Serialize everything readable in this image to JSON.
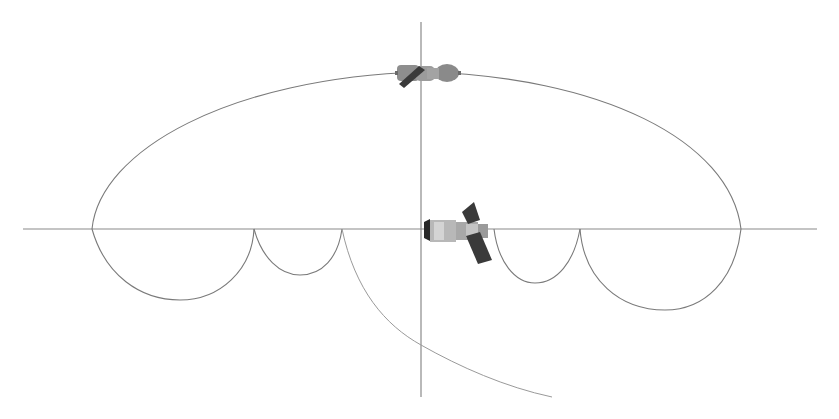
{
  "diagram": {
    "colors": {
      "background": "#ffffff",
      "axis": "#8a8a8a",
      "orbit": "#7a7a7a",
      "panel_dark": "#3f3f3f",
      "body_grey": "#9a9a9a"
    },
    "axes": {
      "horizontal": {
        "x1": 23,
        "y": 229,
        "x2": 817
      },
      "vertical": {
        "x": 421,
        "y1": 22,
        "y2": 397
      }
    },
    "transfer_ellipse": {
      "left_vertex": [
        92,
        229
      ],
      "apex": [
        421,
        72
      ],
      "right_vertex": [
        741,
        229
      ]
    },
    "phasing_arcs": [
      {
        "from": [
          92,
          229
        ],
        "to": [
          254,
          229
        ],
        "depth": 300
      },
      {
        "from": [
          254,
          229
        ],
        "to": [
          342,
          229
        ],
        "depth": 275
      },
      {
        "from": [
          494,
          229
        ],
        "to": [
          580,
          229
        ],
        "depth": 283
      },
      {
        "from": [
          580,
          229
        ],
        "to": [
          741,
          229
        ],
        "depth": 310
      }
    ],
    "descent_trajectory": {
      "start": [
        342,
        229
      ],
      "axis_crossing": [
        421,
        345
      ],
      "end": [
        552,
        397
      ]
    },
    "spacecraft": [
      {
        "name": "chaser-spacecraft",
        "icon": "soyuz-spacecraft-icon",
        "position": [
          427,
          73
        ]
      },
      {
        "name": "target-station",
        "icon": "space-station-icon",
        "position": [
          456,
          230
        ]
      }
    ]
  }
}
